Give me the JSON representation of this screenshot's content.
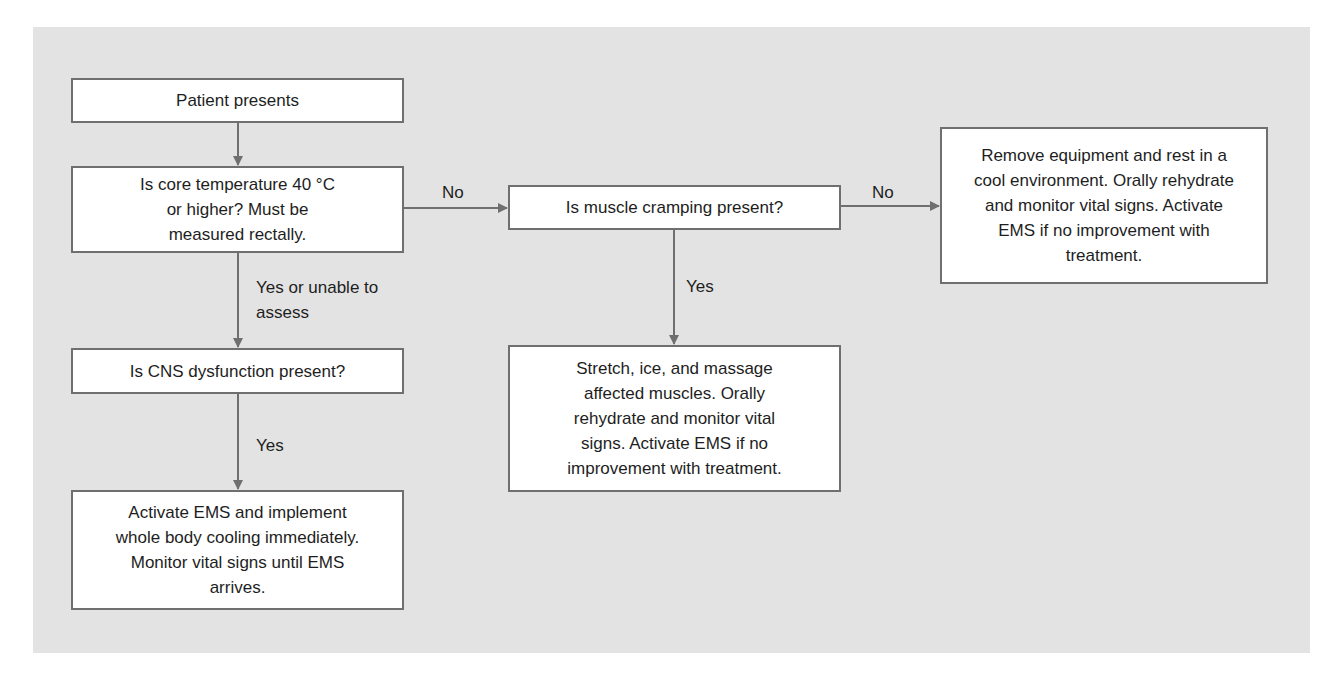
{
  "diagram": {
    "type": "flowchart",
    "colors": {
      "panel_background": "#e3e3e3",
      "box_background": "#ffffff",
      "box_border": "#6f6f6f",
      "arrow": "#6f6f6f",
      "text": "#1e1e1e"
    },
    "nodes": {
      "patient_presents": {
        "text": "Patient presents"
      },
      "core_temp_question": {
        "text": "Is core temperature 40 °C or higher? Must be measured rectally."
      },
      "cns_question": {
        "text": "Is CNS dysfunction present?"
      },
      "activate_ems_cooling": {
        "text": "Activate EMS and implement whole body cooling immediately. Monitor vital signs until EMS arrives."
      },
      "muscle_cramping_question": {
        "text": "Is muscle cramping present?"
      },
      "stretch_ice_massage": {
        "text": "Stretch, ice, and massage affected muscles. Orally rehydrate and monitor vital signs. Activate EMS if no improvement with treatment."
      },
      "remove_equipment_rest": {
        "text": "Remove equipment and rest in a cool environment. Orally rehydrate and monitor vital signs. Activate EMS if no improvement with treatment."
      }
    },
    "edges": {
      "patient_to_temp": {
        "from": "patient_presents",
        "to": "core_temp_question",
        "label": ""
      },
      "temp_to_cns": {
        "from": "core_temp_question",
        "to": "cns_question",
        "label": "Yes or unable to assess"
      },
      "temp_to_muscle": {
        "from": "core_temp_question",
        "to": "muscle_cramping_question",
        "label": "No"
      },
      "cns_to_activate": {
        "from": "cns_question",
        "to": "activate_ems_cooling",
        "label": "Yes"
      },
      "muscle_to_stretch": {
        "from": "muscle_cramping_question",
        "to": "stretch_ice_massage",
        "label": "Yes"
      },
      "muscle_to_remove": {
        "from": "muscle_cramping_question",
        "to": "remove_equipment_rest",
        "label": "No"
      }
    }
  }
}
